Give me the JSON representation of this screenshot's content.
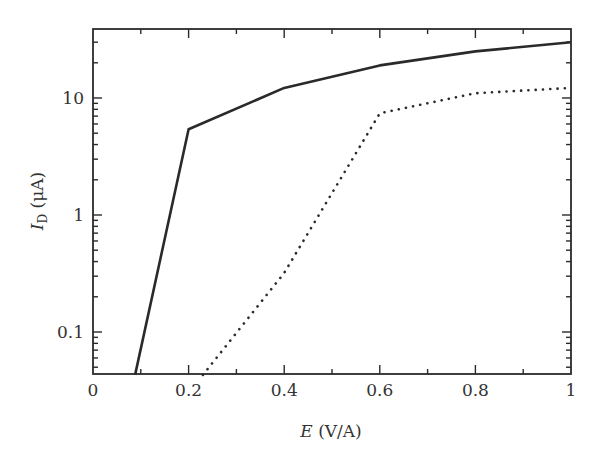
{
  "chart_data": {
    "type": "line",
    "title": "",
    "xlabel": "E (V/A)",
    "xlabel_parts": {
      "symbol": "E",
      "unit": " (V/A)"
    },
    "ylabel": "I_D (μA)",
    "ylabel_parts": {
      "symbol": "I",
      "subscript": "D",
      "unit": " (μA)"
    },
    "xlim": [
      0,
      1
    ],
    "ylim": [
      0.043,
      39
    ],
    "yscale": "log",
    "grid": false,
    "legend": null,
    "x_ticks": [
      0,
      0.2,
      0.4,
      0.6,
      0.8,
      1
    ],
    "x_tick_labels": [
      "0",
      "0.2",
      "0.4",
      "0.6",
      "0.8",
      "1"
    ],
    "x_minor_ticks": [
      0.1,
      0.3,
      0.5,
      0.7,
      0.9
    ],
    "y_ticks": [
      0.1,
      1,
      10
    ],
    "y_tick_labels": [
      "0.1",
      "1",
      "10"
    ],
    "series": [
      {
        "name": "solid",
        "style": "solid",
        "color": "#2a2a2a",
        "x": [
          0.088,
          0.2,
          0.4,
          0.6,
          0.8,
          1.0
        ],
        "values": [
          0.043,
          5.4,
          12.2,
          19,
          25,
          30
        ]
      },
      {
        "name": "dotted",
        "style": "dotted",
        "color": "#2a2a2a",
        "x": [
          0.23,
          0.4,
          0.6,
          0.8,
          1.0
        ],
        "values": [
          0.043,
          0.32,
          7.4,
          11,
          12.2
        ]
      }
    ]
  }
}
